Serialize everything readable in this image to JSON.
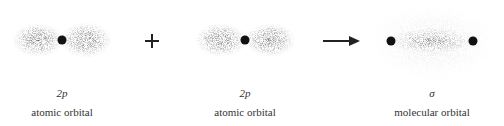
{
  "panels": [
    {
      "id": "left",
      "symbol": "2p",
      "caption": "atomic orbital",
      "center_x": 62
    },
    {
      "id": "middle",
      "symbol": "2p",
      "caption": "atomic orbital",
      "center_x": 245
    },
    {
      "id": "right",
      "symbol": "σ",
      "caption": "molecular orbital",
      "center_x": 432
    }
  ],
  "operators": {
    "plus": "+",
    "arrow": "→"
  },
  "colors": {
    "dot": "#111111",
    "cloud": "#555555",
    "text": "#333333"
  }
}
